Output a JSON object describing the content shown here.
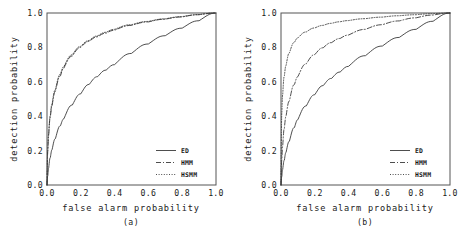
{
  "figure": {
    "panels": [
      {
        "caption": "(a)",
        "xlabel": "false alarm probability",
        "ylabel": "detection probability",
        "xticks": [
          "0.0",
          "0.2",
          "0.4",
          "0.6",
          "0.8",
          "1.0"
        ],
        "yticks": [
          "0.0",
          "0.2",
          "0.4",
          "0.6",
          "0.8",
          "1.0"
        ],
        "legend": [
          {
            "label": "ED",
            "style": "solid"
          },
          {
            "label": "HMM",
            "style": "dashdot"
          },
          {
            "label": "HSMM",
            "style": "dotted"
          }
        ]
      },
      {
        "caption": "(b)",
        "xlabel": "false alarm probability",
        "ylabel": "detection probability",
        "xticks": [
          "0.0",
          "0.2",
          "0.4",
          "0.6",
          "0.8",
          "1.0"
        ],
        "yticks": [
          "0.0",
          "0.2",
          "0.4",
          "0.6",
          "0.8",
          "1.0"
        ],
        "legend": [
          {
            "label": "ED",
            "style": "solid"
          },
          {
            "label": "HMM",
            "style": "dashdot"
          },
          {
            "label": "HSMM",
            "style": "dotted"
          }
        ]
      }
    ]
  },
  "chart_data": [
    {
      "type": "line",
      "title": "",
      "subtitle": "(a)",
      "xlabel": "false alarm probability",
      "ylabel": "detection probability",
      "xlim": [
        0.0,
        1.0
      ],
      "ylim": [
        0.0,
        1.0
      ],
      "xticks": [
        0.0,
        0.2,
        0.4,
        0.6,
        0.8,
        1.0
      ],
      "yticks": [
        0.0,
        0.2,
        0.4,
        0.6,
        0.8,
        1.0
      ],
      "grid": false,
      "legend_position": "lower-right",
      "x": [
        0.0,
        0.005,
        0.01,
        0.02,
        0.03,
        0.05,
        0.08,
        0.1,
        0.15,
        0.2,
        0.25,
        0.3,
        0.35,
        0.4,
        0.5,
        0.6,
        0.7,
        0.8,
        0.9,
        1.0
      ],
      "series": [
        {
          "name": "ED",
          "style": "solid",
          "values": [
            0.0,
            0.055,
            0.1,
            0.16,
            0.205,
            0.27,
            0.345,
            0.385,
            0.465,
            0.53,
            0.585,
            0.63,
            0.668,
            0.7,
            0.765,
            0.82,
            0.868,
            0.912,
            0.955,
            1.0
          ]
        },
        {
          "name": "HMM",
          "style": "dashdot",
          "values": [
            0.0,
            0.2,
            0.29,
            0.395,
            0.46,
            0.545,
            0.635,
            0.68,
            0.75,
            0.8,
            0.835,
            0.862,
            0.883,
            0.9,
            0.928,
            0.948,
            0.964,
            0.977,
            0.99,
            1.0
          ]
        },
        {
          "name": "HSMM",
          "style": "dotted",
          "values": [
            0.0,
            0.21,
            0.3,
            0.405,
            0.47,
            0.555,
            0.645,
            0.688,
            0.757,
            0.806,
            0.84,
            0.867,
            0.888,
            0.905,
            0.932,
            0.951,
            0.966,
            0.979,
            0.991,
            1.0
          ]
        }
      ]
    },
    {
      "type": "line",
      "title": "",
      "subtitle": "(b)",
      "xlabel": "false alarm probability",
      "ylabel": "detection probability",
      "xlim": [
        0.0,
        1.0
      ],
      "ylim": [
        0.0,
        1.0
      ],
      "xticks": [
        0.0,
        0.2,
        0.4,
        0.6,
        0.8,
        1.0
      ],
      "yticks": [
        0.0,
        0.2,
        0.4,
        0.6,
        0.8,
        1.0
      ],
      "grid": false,
      "legend_position": "lower-right",
      "x": [
        0.0,
        0.005,
        0.01,
        0.02,
        0.03,
        0.05,
        0.08,
        0.1,
        0.15,
        0.2,
        0.25,
        0.3,
        0.35,
        0.4,
        0.5,
        0.6,
        0.7,
        0.8,
        0.9,
        1.0
      ],
      "series": [
        {
          "name": "ED",
          "style": "solid",
          "values": [
            0.0,
            0.05,
            0.09,
            0.145,
            0.19,
            0.255,
            0.335,
            0.38,
            0.46,
            0.525,
            0.578,
            0.62,
            0.657,
            0.69,
            0.752,
            0.808,
            0.858,
            0.905,
            0.952,
            1.0
          ]
        },
        {
          "name": "HMM",
          "style": "dashdot",
          "values": [
            0.0,
            0.145,
            0.225,
            0.33,
            0.4,
            0.49,
            0.585,
            0.63,
            0.705,
            0.758,
            0.798,
            0.828,
            0.852,
            0.872,
            0.905,
            0.932,
            0.954,
            0.972,
            0.988,
            1.0
          ]
        },
        {
          "name": "HSMM",
          "style": "dotted",
          "values": [
            0.0,
            0.42,
            0.525,
            0.635,
            0.695,
            0.768,
            0.83,
            0.855,
            0.89,
            0.913,
            0.928,
            0.94,
            0.949,
            0.956,
            0.967,
            0.976,
            0.984,
            0.99,
            0.996,
            1.0
          ]
        }
      ]
    }
  ]
}
